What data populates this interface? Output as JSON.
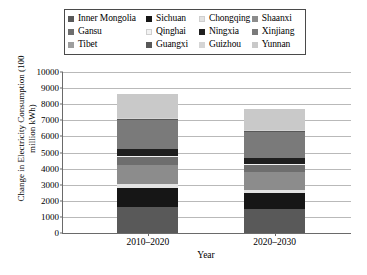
{
  "legend": {
    "rows": [
      [
        {
          "label": "Inner Mongolia",
          "color": "#595959"
        },
        {
          "label": "Sichuan",
          "color": "#161616"
        },
        {
          "label": "Chongqing",
          "color": "#e3e3e3"
        },
        {
          "label": "Shaanxi",
          "color": "#8c8c8c"
        }
      ],
      [
        {
          "label": "Gansu",
          "color": "#6e6e6e"
        },
        {
          "label": "Qinghai",
          "color": "#f2f2f2"
        },
        {
          "label": "Ningxia",
          "color": "#1f1f1f"
        },
        {
          "label": "Xinjiang",
          "color": "#7a7a7a"
        }
      ],
      [
        {
          "label": "Tibet",
          "color": "#9e9e9e"
        },
        {
          "label": "Guangxi",
          "color": "#585858"
        },
        {
          "label": "Guizhou",
          "color": "#d5d5d5"
        },
        {
          "label": "Yunnan",
          "color": "#c9c9c9"
        }
      ]
    ]
  },
  "axes": {
    "ylabel": "Change in Electricity Consumption (100 million kWh)",
    "xlabel": "Year",
    "yticks": [
      "10000",
      "9000",
      "8000",
      "7000",
      "6000",
      "5000",
      "4000",
      "3000",
      "2000",
      "1000",
      "0"
    ],
    "xticks": [
      "2010–2020",
      "2020–2030"
    ]
  },
  "chart_data": {
    "type": "bar",
    "title": "",
    "xlabel": "Year",
    "ylabel": "Change in Electricity Consumption (100 million kWh)",
    "ylim": [
      0,
      10000
    ],
    "ytick_step": 1000,
    "grid": true,
    "stacked": true,
    "legend_position": "top",
    "categories": [
      "2010–2020",
      "2020–2030"
    ],
    "series": [
      {
        "name": "Inner Mongolia",
        "color": "#595959",
        "values": [
          1600,
          1500
        ]
      },
      {
        "name": "Sichuan",
        "color": "#161616",
        "values": [
          1200,
          1000
        ]
      },
      {
        "name": "Chongqing",
        "color": "#e3e3e3",
        "values": [
          250,
          200
        ]
      },
      {
        "name": "Shaanxi",
        "color": "#8c8c8c",
        "values": [
          1200,
          1100
        ]
      },
      {
        "name": "Gansu",
        "color": "#6e6e6e",
        "values": [
          450,
          400
        ]
      },
      {
        "name": "Qinghai",
        "color": "#f2f2f2",
        "values": [
          100,
          100
        ]
      },
      {
        "name": "Ningxia",
        "color": "#1f1f1f",
        "values": [
          400,
          350
        ]
      },
      {
        "name": "Xinjiang",
        "color": "#7a7a7a",
        "values": [
          1800,
          1600
        ]
      },
      {
        "name": "Tibet",
        "color": "#9e9e9e",
        "values": [
          50,
          50
        ]
      },
      {
        "name": "Guangxi",
        "color": "#585858",
        "values": [
          50,
          50
        ]
      },
      {
        "name": "Guizhou",
        "color": "#d5d5d5",
        "values": [
          50,
          50
        ]
      },
      {
        "name": "Yunnan",
        "color": "#c9c9c9",
        "values": [
          1500,
          1300
        ]
      }
    ],
    "totals": [
      8650,
      7700
    ]
  }
}
